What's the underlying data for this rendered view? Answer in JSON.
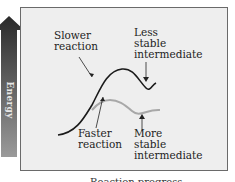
{
  "diagram": {
    "y_axis_arrow_label": "Energy",
    "x_axis_label": "Reaction progress",
    "curves": [
      {
        "name": "slower-reaction",
        "color": "#1a1a1a",
        "label": "Slower\nreaction",
        "end_label": "Less\nstable\nintermediate"
      },
      {
        "name": "faster-reaction",
        "color": "#a8a8a8",
        "label": "Faster\nreaction",
        "end_label": "More\nstable\nintermediate"
      }
    ],
    "colors": {
      "box_bg": "#eeeeee",
      "box_border": "#6a6a6a",
      "arrow_top": "#2a2a2a",
      "arrow_bottom": "#9a9a9a"
    }
  }
}
